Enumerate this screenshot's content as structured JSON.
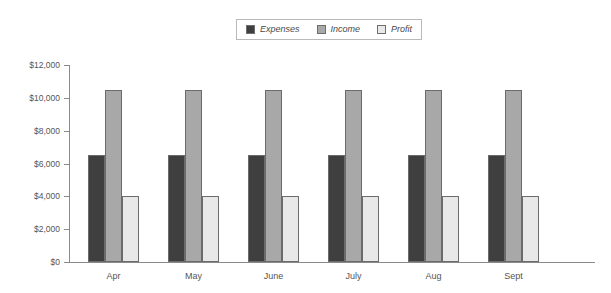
{
  "legend": {
    "position": "top-center",
    "entries": [
      {
        "label": "Expenses",
        "color": "#3f3f3f",
        "swatch_name": "legend-swatch-expenses"
      },
      {
        "label": "Income",
        "color": "#a8a8a8",
        "swatch_name": "legend-swatch-income"
      },
      {
        "label": "Profit",
        "color": "#e8e8e8",
        "swatch_name": "legend-swatch-profit"
      }
    ]
  },
  "chart_data": {
    "type": "bar",
    "title": "",
    "subtitle": "",
    "xlabel": "",
    "ylabel": "",
    "categories": [
      "Apr",
      "May",
      "June",
      "July",
      "Aug",
      "Sept"
    ],
    "series": [
      {
        "name": "Expenses",
        "color": "#3f3f3f",
        "values": [
          6500,
          6500,
          6500,
          6500,
          6500,
          6500
        ]
      },
      {
        "name": "Income",
        "color": "#a8a8a8",
        "values": [
          10500,
          10500,
          10500,
          10500,
          10500,
          10500
        ]
      },
      {
        "name": "Profit",
        "color": "#e8e8e8",
        "values": [
          4000,
          4000,
          4000,
          4000,
          4000,
          4000
        ]
      }
    ],
    "ylim": [
      0,
      12000
    ],
    "yticks": [
      0,
      2000,
      4000,
      6000,
      8000,
      10000,
      12000
    ],
    "ytick_labels": [
      "$0",
      "$2,000",
      "$4,000",
      "$6,000",
      "$8,000",
      "$10,000",
      "$12,000"
    ],
    "grid": false,
    "legend_position": "top-center"
  },
  "axis": {
    "line_color": "#8a8a8a"
  }
}
